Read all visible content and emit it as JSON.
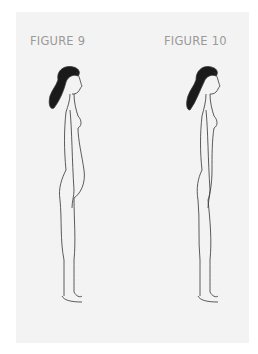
{
  "figures": [
    {
      "caption": "FIGURE 9",
      "description": "side-profile line drawing of a standing woman, pregnant belly"
    },
    {
      "caption": "FIGURE 10",
      "description": "side-profile line drawing of a standing woman, flat belly"
    }
  ],
  "colors": {
    "panel": "#f3f3f3",
    "caption": "#9a9a9a",
    "line": "#333333",
    "hair": "#1a1a1a"
  }
}
